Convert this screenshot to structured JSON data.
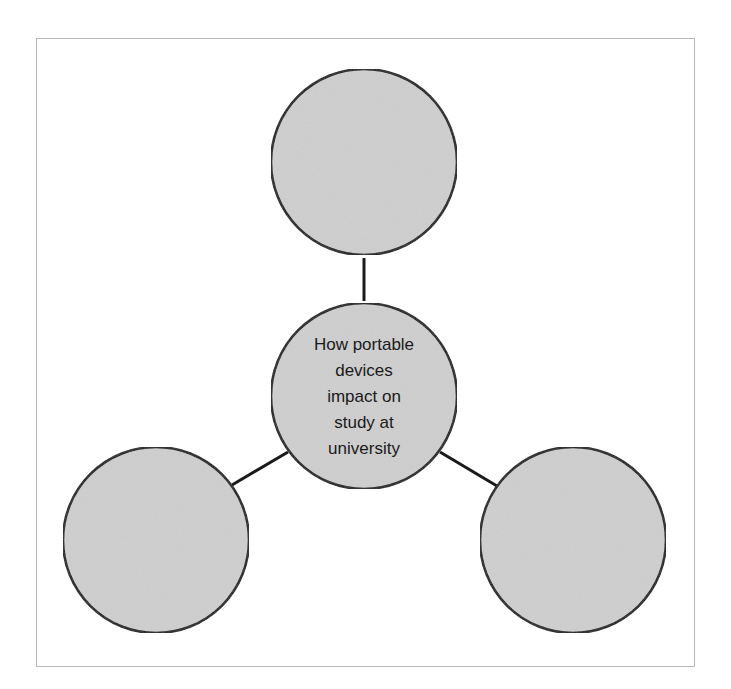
{
  "diagram": {
    "type": "spider-diagram",
    "colors": {
      "node_fill": "#cfcfcf",
      "node_stroke": "#1a1a1a",
      "connector": "#1a1a1a",
      "frame_border": "#b8b8b8",
      "background": "#ffffff"
    },
    "center_node": {
      "label_lines": [
        "How portable",
        "devices",
        "impact on",
        "study at",
        "university"
      ],
      "label": "How portable devices impact on study at university"
    },
    "outer_nodes": [
      {
        "position": "top",
        "label": ""
      },
      {
        "position": "bottom-left",
        "label": ""
      },
      {
        "position": "bottom-right",
        "label": ""
      }
    ]
  }
}
